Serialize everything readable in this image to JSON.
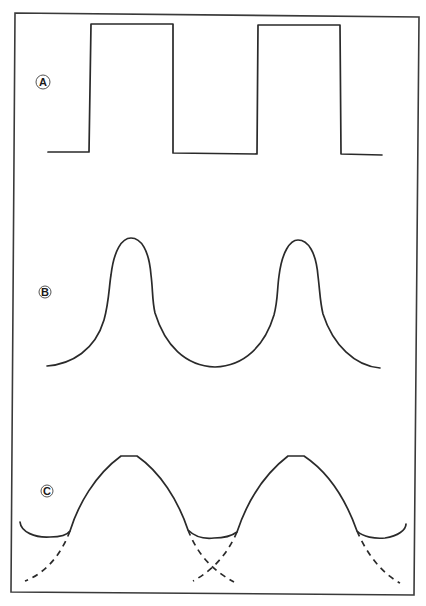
{
  "figure": {
    "panels": [
      {
        "id": "A",
        "label": "A",
        "description": "square wave",
        "label_pos": [
          43,
          82
        ]
      },
      {
        "id": "B",
        "label": "B",
        "description": "narrow peaks on broad valleys",
        "label_pos": [
          45,
          292
        ]
      },
      {
        "id": "C",
        "label": "C",
        "description": "broad arcs with overlapping dashed tails",
        "label_pos": [
          47,
          491
        ]
      }
    ],
    "colors": {
      "line": "#2a2a2a",
      "frame": "#3a3a3a",
      "background": "#ffffff"
    }
  }
}
